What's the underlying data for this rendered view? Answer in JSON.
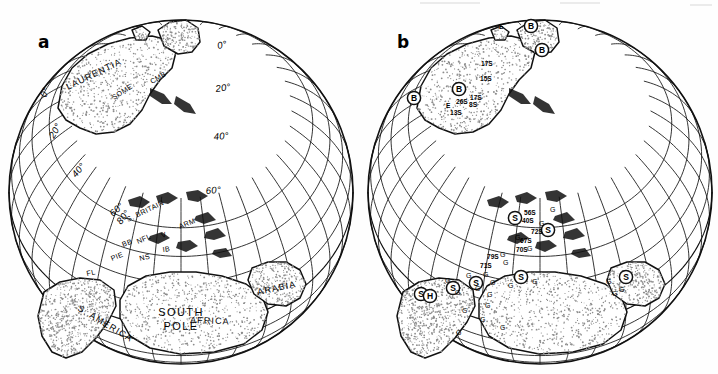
{
  "figure": {
    "type": "paleogeographic-globe-pair",
    "background": "#fefefe",
    "line_color": "#111111",
    "stipple_color": "#8c8c8c",
    "width": 718,
    "height": 374
  },
  "panels": [
    {
      "id": "a",
      "letter": "a",
      "center": {
        "x": 181,
        "y": 192
      },
      "radius": 172,
      "pole_label_line1": "SOUTH",
      "pole_label_line2": "POLE",
      "latitude_labels": [
        {
          "text": "0°",
          "x": 218,
          "y": 49,
          "rot": -12
        },
        {
          "text": "20°",
          "x": 216,
          "y": 92,
          "rot": -8
        },
        {
          "text": "40°",
          "x": 214,
          "y": 140,
          "rot": -5
        },
        {
          "text": "60°",
          "x": 206,
          "y": 194,
          "rot": -4
        },
        {
          "text": "0°",
          "x": 46,
          "y": 98,
          "rot": -70
        },
        {
          "text": "20°",
          "x": 54,
          "y": 139,
          "rot": -60
        },
        {
          "text": "40°",
          "x": 76,
          "y": 178,
          "rot": -50
        },
        {
          "text": "60°",
          "x": 113,
          "y": 217,
          "rot": -42
        },
        {
          "text": "80°",
          "x": 121,
          "y": 225,
          "rot": -52
        }
      ],
      "continent_labels": [
        {
          "text": "LAURENTIA",
          "x": 68,
          "y": 90,
          "rot": -26
        },
        {
          "text": "S. AMERICA",
          "x": 77,
          "y": 310,
          "rot": 31
        },
        {
          "text": "AFRICA",
          "x": 190,
          "y": 323,
          "rot": 2
        },
        {
          "text": "ARABIA",
          "x": 258,
          "y": 295,
          "rot": -12
        }
      ],
      "terrane_labels": [
        {
          "text": "SOME",
          "x": 114,
          "y": 100,
          "rot": -33
        },
        {
          "text": "CMB",
          "x": 152,
          "y": 84,
          "rot": -30
        },
        {
          "text": "S. BRITAIN",
          "x": 128,
          "y": 222,
          "rot": -26
        },
        {
          "text": "ARM",
          "x": 180,
          "y": 229,
          "rot": -22
        },
        {
          "text": "BB",
          "x": 123,
          "y": 247,
          "rot": -20
        },
        {
          "text": "NFL",
          "x": 138,
          "y": 244,
          "rot": -24
        },
        {
          "text": "V",
          "x": 162,
          "y": 238,
          "rot": -18
        },
        {
          "text": "IB",
          "x": 163,
          "y": 252,
          "rot": -8
        },
        {
          "text": "PIE",
          "x": 112,
          "y": 261,
          "rot": -22
        },
        {
          "text": "NS",
          "x": 140,
          "y": 261,
          "rot": -14
        },
        {
          "text": "FL",
          "x": 87,
          "y": 276,
          "rot": -12
        }
      ]
    },
    {
      "id": "b",
      "letter": "b",
      "center": {
        "x": 540,
        "y": 192
      },
      "radius": 172,
      "markers": [
        {
          "symbol": "B",
          "x": 531,
          "y": 26
        },
        {
          "symbol": "B",
          "x": 542,
          "y": 50
        },
        {
          "symbol": "B",
          "x": 459,
          "y": 89
        },
        {
          "symbol": "B",
          "x": 414,
          "y": 98
        },
        {
          "symbol": "S",
          "x": 515,
          "y": 218
        },
        {
          "symbol": "S",
          "x": 548,
          "y": 230
        },
        {
          "symbol": "S",
          "x": 521,
          "y": 277
        },
        {
          "symbol": "S",
          "x": 476,
          "y": 283
        },
        {
          "symbol": "S",
          "x": 453,
          "y": 288
        },
        {
          "symbol": "S",
          "x": 421,
          "y": 294
        },
        {
          "symbol": "H",
          "x": 430,
          "y": 296
        },
        {
          "symbol": "S",
          "x": 626,
          "y": 277
        }
      ],
      "value_labels": [
        {
          "text": "17S",
          "x": 481,
          "y": 66
        },
        {
          "text": "15S",
          "x": 480,
          "y": 81
        },
        {
          "text": "17S",
          "x": 470,
          "y": 100
        },
        {
          "text": "E",
          "x": 446,
          "y": 108
        },
        {
          "text": "26S",
          "x": 456,
          "y": 104
        },
        {
          "text": "8S",
          "x": 469,
          "y": 107
        },
        {
          "text": "13S",
          "x": 450,
          "y": 115
        },
        {
          "text": "E",
          "x": 499,
          "y": 29
        },
        {
          "text": "56S",
          "x": 524,
          "y": 215
        },
        {
          "text": "40S",
          "x": 522,
          "y": 223
        },
        {
          "text": "72S",
          "x": 531,
          "y": 234
        },
        {
          "text": "67S",
          "x": 520,
          "y": 243
        },
        {
          "text": "70S",
          "x": 516,
          "y": 252
        },
        {
          "text": "79S",
          "x": 487,
          "y": 259
        },
        {
          "text": "71S",
          "x": 480,
          "y": 268
        }
      ],
      "g_letters": [
        {
          "x": 550,
          "y": 212
        },
        {
          "x": 539,
          "y": 226
        },
        {
          "x": 515,
          "y": 240
        },
        {
          "x": 527,
          "y": 251
        },
        {
          "x": 500,
          "y": 257
        },
        {
          "x": 503,
          "y": 265
        },
        {
          "x": 483,
          "y": 277
        },
        {
          "x": 466,
          "y": 278
        },
        {
          "x": 445,
          "y": 283
        },
        {
          "x": 490,
          "y": 285
        },
        {
          "x": 475,
          "y": 291
        },
        {
          "x": 508,
          "y": 288
        },
        {
          "x": 532,
          "y": 284
        },
        {
          "x": 455,
          "y": 295
        },
        {
          "x": 487,
          "y": 297
        },
        {
          "x": 485,
          "y": 308
        },
        {
          "x": 462,
          "y": 313
        },
        {
          "x": 480,
          "y": 322
        },
        {
          "x": 500,
          "y": 330
        },
        {
          "x": 456,
          "y": 335
        },
        {
          "x": 606,
          "y": 284
        },
        {
          "x": 619,
          "y": 292
        },
        {
          "x": 612,
          "y": 296
        }
      ]
    }
  ],
  "graticule": {
    "latitude_step_deg": 10,
    "longitude_step_deg": 10,
    "projection": "orthographic-south-polar"
  }
}
